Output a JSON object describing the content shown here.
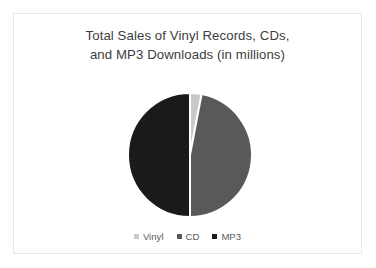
{
  "slide": {
    "background_color": "#ffffff",
    "border_color": "#e9e9e9"
  },
  "chart_data": {
    "type": "pie",
    "title": "Total Sales of Vinyl Records, CDs, and MP3 Downloads (in millions)",
    "title_lines": [
      "Total Sales of Vinyl Records, CDs,",
      "and MP3 Downloads (in millions)"
    ],
    "xlabel": "",
    "ylabel": "",
    "categories": [
      "Vinyl",
      "CD",
      "MP3"
    ],
    "values": [
      3,
      47,
      50
    ],
    "units": "millions",
    "slices": [
      {
        "label": "Vinyl",
        "value": 3,
        "percent": 3,
        "start_angle_deg": 0,
        "end_angle_deg": 10.8,
        "color": "#c9c9c9"
      },
      {
        "label": "CD",
        "value": 47,
        "percent": 47,
        "start_angle_deg": 10.8,
        "end_angle_deg": 180.0,
        "color": "#595959"
      },
      {
        "label": "MP3",
        "value": 50,
        "percent": 50,
        "start_angle_deg": 180.0,
        "end_angle_deg": 360,
        "color": "#1a1a1a"
      }
    ],
    "start_angle_deg": 0,
    "direction": "clockwise",
    "slice_separator_color": "#ffffff",
    "data_labels_shown": false,
    "grid": false,
    "legend": {
      "position": "bottom",
      "entries": [
        {
          "label": "Vinyl",
          "color": "#c9c9c9"
        },
        {
          "label": "CD",
          "color": "#595959"
        },
        {
          "label": "MP3",
          "color": "#1a1a1a"
        }
      ]
    }
  }
}
